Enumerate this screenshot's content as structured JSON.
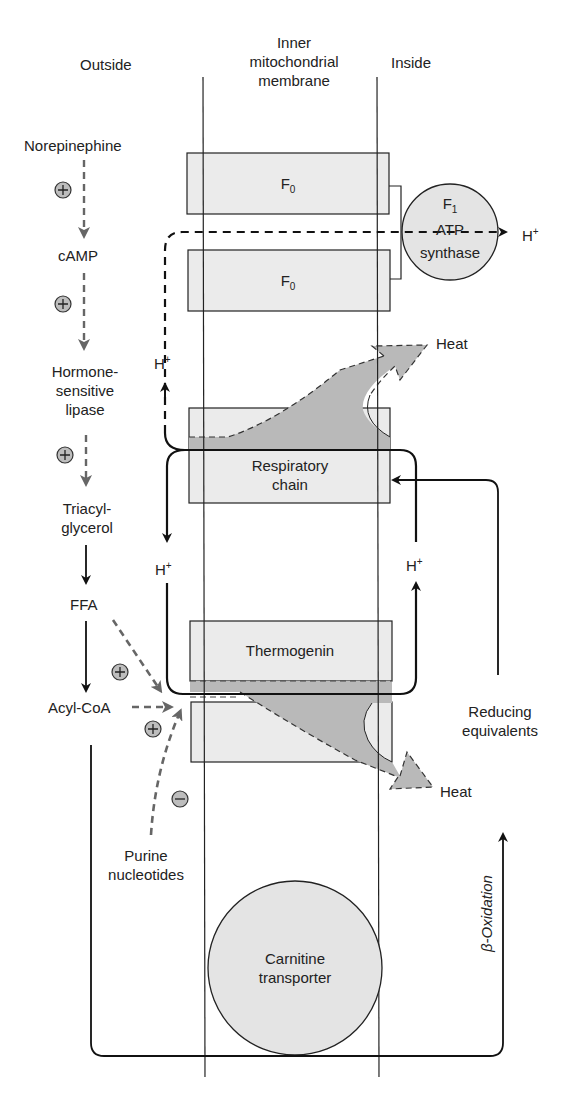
{
  "headers": {
    "outside": "Outside",
    "membrane": [
      "Inner",
      "mitochondrial",
      "membrane"
    ],
    "inside": "Inside"
  },
  "pathway": {
    "norepinephine": "Norepinephine",
    "camp": "cAMP",
    "hsl": [
      "Hormone-",
      "sensitive",
      "lipase"
    ],
    "tag": [
      "Triacyl-",
      "glycerol"
    ],
    "ffa": "FFA",
    "acyl_coa": "Acyl-CoA",
    "purine": [
      "Purine",
      "nucleotides"
    ],
    "plus": "+",
    "minus": "−"
  },
  "membrane_components": {
    "f0_top": {
      "base": "F",
      "sub": "0"
    },
    "f0_bottom": {
      "base": "F",
      "sub": "0"
    },
    "f1": {
      "base": "F",
      "sub": "1",
      "line2": "ATP",
      "line3": "synthase"
    },
    "respiratory_chain": [
      "Respiratory",
      "chain"
    ],
    "thermogenin": "Thermogenin",
    "carnitine": [
      "Carnitine",
      "transporter"
    ]
  },
  "flows": {
    "h_plus": {
      "base": "H",
      "sup": "+"
    },
    "heat": "Heat",
    "reducing_equivalents": [
      "Reducing",
      "equivalents"
    ],
    "beta_oxidation": "β-Oxidation"
  },
  "colors": {
    "box_fill": "#ebebeb",
    "heat_fill": "#b9b9b9",
    "dashed_gray": "#6a6a6a",
    "line": "#1a1a1a",
    "circle_fill": "#e4e4e4"
  }
}
